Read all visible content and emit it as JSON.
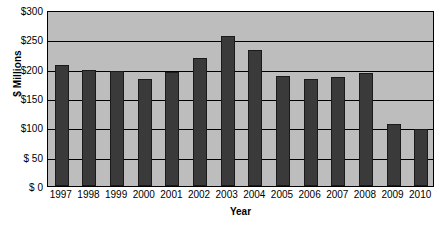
{
  "chart_data": {
    "type": "bar",
    "title": "",
    "xlabel": "Year",
    "ylabel": "$ Millions",
    "categories": [
      "1997",
      "1998",
      "1999",
      "2000",
      "2001",
      "2002",
      "2003",
      "2004",
      "2005",
      "2006",
      "2007",
      "2008",
      "2009",
      "2010"
    ],
    "values": [
      207,
      197,
      196,
      183,
      194,
      219,
      256,
      231,
      188,
      183,
      186,
      192,
      106,
      98
    ],
    "ylim": [
      0,
      300
    ],
    "ytick_labels": [
      "$300",
      "$250",
      "$200",
      "$150",
      "$100",
      "$  50",
      "$   0"
    ],
    "ytick_values": [
      300,
      250,
      200,
      150,
      100,
      50,
      0
    ],
    "grid": true,
    "legend": "none",
    "colors": {
      "bar": "#3a3a3a",
      "bar_border": "#1a1a1a",
      "plot_background": "#bdbdbd",
      "page_background": "#ffffff",
      "axis": "#000000",
      "gridline": "#000000",
      "text": "#000000"
    }
  }
}
